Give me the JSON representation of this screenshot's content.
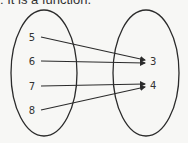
{
  "caption": ": It is a function.",
  "domain_set": {
    "name": "domain",
    "elements": [
      "5",
      "6",
      "7",
      "8"
    ]
  },
  "range_set": {
    "name": "range",
    "elements": [
      "3",
      "4"
    ]
  },
  "mappings": [
    {
      "from": "5",
      "to": "3"
    },
    {
      "from": "6",
      "to": "3"
    },
    {
      "from": "7",
      "to": "4"
    },
    {
      "from": "8",
      "to": "4"
    }
  ],
  "colors": {
    "stroke": "#2b2b2b",
    "text": "#333333",
    "background": "#f7f7f5"
  }
}
